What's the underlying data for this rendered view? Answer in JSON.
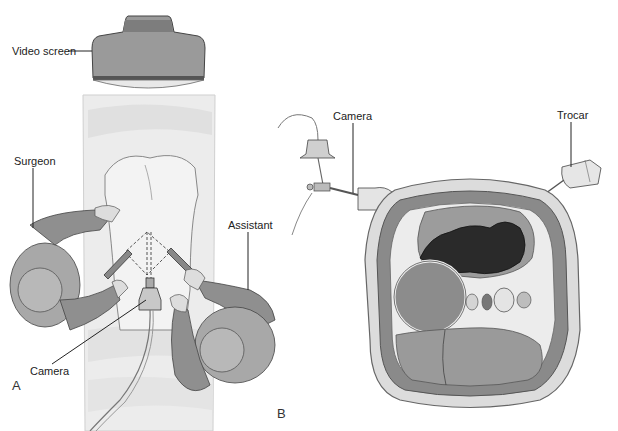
{
  "figure": {
    "panels": [
      {
        "id": "A",
        "letter": "A",
        "labels": {
          "video_screen": "Video screen",
          "surgeon": "Surgeon",
          "assistant": "Assistant",
          "camera": "Camera"
        }
      },
      {
        "id": "B",
        "letter": "B",
        "labels": {
          "camera": "Camera",
          "trocar": "Trocar"
        }
      }
    ]
  },
  "colors": {
    "background": "#ffffff",
    "line": "#222222",
    "gown": "#8f8f8f",
    "gown_light": "#b4b4b4",
    "drape": "#e6e6e6",
    "tissue": "#7a7a7a",
    "dark_organ": "#2a2a2a"
  }
}
